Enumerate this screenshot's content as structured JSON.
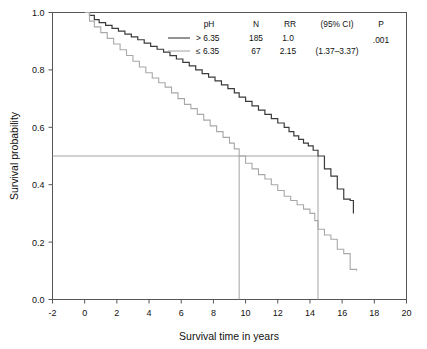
{
  "chart_data": {
    "type": "line",
    "title": "",
    "xlabel": "Survival time in years",
    "ylabel": "Survival probability",
    "xlim": [
      -2,
      20
    ],
    "ylim": [
      0.0,
      1.0
    ],
    "xticks": [
      -2,
      0,
      2,
      4,
      6,
      8,
      10,
      12,
      14,
      16,
      18,
      20
    ],
    "xticklabels": [
      "-2",
      "0",
      "2",
      "4",
      "6",
      "8",
      "10",
      "12",
      "14",
      "16",
      "18",
      "20"
    ],
    "yticks": [
      0.0,
      0.2,
      0.4,
      0.6,
      0.8,
      1.0
    ],
    "yticklabels": [
      "0.0",
      "0.2",
      "0.4",
      "0.6",
      "0.8",
      "1.0"
    ],
    "grid": false,
    "legend_position": "top-center",
    "step_style": "post",
    "reference_lines": {
      "median_probability": 0.5,
      "horizontal_line_y": 0.5,
      "horizontal_line_x_end": 14.5,
      "median_survival_high_ph": 14.5,
      "median_survival_low_ph": 9.6,
      "color": "#9a9a9a"
    },
    "series": [
      {
        "name": "> 6.35",
        "color": "#3b3b3b",
        "n": 185,
        "rr": "1.0",
        "ci": "",
        "points": [
          [
            0,
            1.0
          ],
          [
            0.3,
            0.99
          ],
          [
            0.6,
            0.975
          ],
          [
            0.9,
            0.965
          ],
          [
            1.3,
            0.955
          ],
          [
            1.7,
            0.945
          ],
          [
            2.1,
            0.935
          ],
          [
            2.5,
            0.925
          ],
          [
            2.9,
            0.915
          ],
          [
            3.3,
            0.905
          ],
          [
            3.7,
            0.893
          ],
          [
            4.1,
            0.882
          ],
          [
            4.5,
            0.872
          ],
          [
            4.9,
            0.862
          ],
          [
            5.3,
            0.85
          ],
          [
            5.7,
            0.838
          ],
          [
            6.1,
            0.826
          ],
          [
            6.5,
            0.814
          ],
          [
            6.9,
            0.8
          ],
          [
            7.3,
            0.787
          ],
          [
            7.7,
            0.775
          ],
          [
            8.1,
            0.762
          ],
          [
            8.5,
            0.748
          ],
          [
            8.9,
            0.735
          ],
          [
            9.3,
            0.72
          ],
          [
            9.6,
            0.705
          ],
          [
            10.0,
            0.69
          ],
          [
            10.4,
            0.675
          ],
          [
            10.8,
            0.66
          ],
          [
            11.2,
            0.645
          ],
          [
            11.6,
            0.63
          ],
          [
            12.0,
            0.615
          ],
          [
            12.4,
            0.6
          ],
          [
            12.7,
            0.585
          ],
          [
            13.0,
            0.57
          ],
          [
            13.3,
            0.558
          ],
          [
            13.6,
            0.545
          ],
          [
            13.9,
            0.535
          ],
          [
            14.2,
            0.52
          ],
          [
            14.5,
            0.5
          ],
          [
            14.9,
            0.455
          ],
          [
            15.3,
            0.43
          ],
          [
            15.7,
            0.385
          ],
          [
            16.1,
            0.35
          ],
          [
            16.5,
            0.345
          ],
          [
            16.7,
            0.3
          ]
        ]
      },
      {
        "name": "≤ 6.35",
        "color": "#a8a8a8",
        "n": 67,
        "rr": "2.15",
        "ci": "(1.37–3.37)",
        "points": [
          [
            0,
            1.0
          ],
          [
            0.3,
            0.97
          ],
          [
            0.6,
            0.95
          ],
          [
            1.0,
            0.93
          ],
          [
            1.4,
            0.91
          ],
          [
            1.8,
            0.89
          ],
          [
            2.2,
            0.87
          ],
          [
            2.6,
            0.85
          ],
          [
            3.0,
            0.83
          ],
          [
            3.4,
            0.81
          ],
          [
            3.8,
            0.79
          ],
          [
            4.2,
            0.772
          ],
          [
            4.6,
            0.755
          ],
          [
            5.0,
            0.74
          ],
          [
            5.4,
            0.72
          ],
          [
            5.8,
            0.7
          ],
          [
            6.2,
            0.68
          ],
          [
            6.6,
            0.665
          ],
          [
            7.0,
            0.645
          ],
          [
            7.4,
            0.625
          ],
          [
            7.8,
            0.605
          ],
          [
            8.2,
            0.585
          ],
          [
            8.6,
            0.565
          ],
          [
            9.0,
            0.545
          ],
          [
            9.3,
            0.525
          ],
          [
            9.6,
            0.5
          ],
          [
            10.0,
            0.475
          ],
          [
            10.4,
            0.455
          ],
          [
            10.8,
            0.435
          ],
          [
            11.2,
            0.42
          ],
          [
            11.6,
            0.4
          ],
          [
            12.0,
            0.38
          ],
          [
            12.4,
            0.36
          ],
          [
            12.8,
            0.345
          ],
          [
            13.2,
            0.33
          ],
          [
            13.6,
            0.315
          ],
          [
            14.0,
            0.3
          ],
          [
            14.3,
            0.275
          ],
          [
            14.5,
            0.245
          ],
          [
            14.9,
            0.225
          ],
          [
            15.3,
            0.21
          ],
          [
            15.7,
            0.175
          ],
          [
            16.1,
            0.16
          ],
          [
            16.5,
            0.105
          ],
          [
            16.9,
            0.1
          ]
        ]
      }
    ]
  },
  "legend": {
    "headers": {
      "ph": "pH",
      "n": "N",
      "rr": "RR",
      "ci": "(95% CI)",
      "p": "P"
    },
    "rows": [
      {
        "ph": "> 6.35",
        "n": "185",
        "rr": "1.0",
        "ci": "",
        "p": ".001"
      },
      {
        "ph": "≤ 6.35",
        "n": "67",
        "rr": "2.15",
        "ci": "(1.37–3.37)",
        "p": ""
      }
    ]
  }
}
